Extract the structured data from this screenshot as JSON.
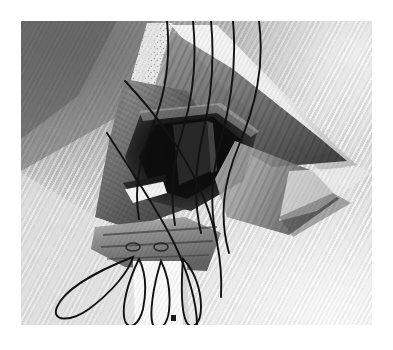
{
  "page": {
    "background_color": "#ffffff",
    "width": 393,
    "height": 350
  },
  "figure": {
    "title": "Surgical exposure illustration",
    "alt_text": "Grayscale surgical photograph-style illustration of a retracted incision showing tissue flaps held open, a dark central cavity, and multiple suture threads looped downward.",
    "caption": "",
    "frame": {
      "x": 21,
      "y": 21,
      "width": 351,
      "height": 304,
      "border_color": "#c8c8c8",
      "background_color": "#d9d9d9"
    },
    "palette": {
      "drape_light": "#e3e3e3",
      "drape_mid": "#b6b6b6",
      "drape_shadow": "#6e6e6e",
      "fascia_edge": "#f2f2f2",
      "tissue_mid": "#8a8a8a",
      "tissue_dark": "#3c3c3c",
      "cavity_black": "#141414",
      "highlight_white": "#ffffff",
      "suture_black": "#111111"
    },
    "regions": [
      {
        "name": "upper-left-drape",
        "tone": "mid-dark gray",
        "description": "Diagonally woven surgical drape sloping from upper left"
      },
      {
        "name": "left-fascia-edge",
        "tone": "bright speckled white",
        "description": "Speckled light band marking the retracted left wound edge"
      },
      {
        "name": "right-fascia-edge",
        "tone": "bright white taper",
        "description": "Wedge-shaped retracted right wound edge narrowing to the right"
      },
      {
        "name": "central-cavity",
        "tone": "near black",
        "description": "Deep shadowed surgical cavity at the center of the exposure"
      },
      {
        "name": "tissue-flap-lower",
        "tone": "mid gray banded",
        "description": "Layered tissue flap with ridges below the cavity"
      },
      {
        "name": "bright-highlight",
        "tone": "white",
        "description": "Specular highlight on a curved instrument or tissue surface"
      },
      {
        "name": "lower-white-strip",
        "tone": "white",
        "description": "White vertical strip descending from the wound toward the bottom edge"
      }
    ],
    "suture_count": 7,
    "suture_loop_count": 4,
    "marker": {
      "name": "orientation-mark",
      "shape": "small dark square",
      "x": 172,
      "y": 318
    }
  }
}
